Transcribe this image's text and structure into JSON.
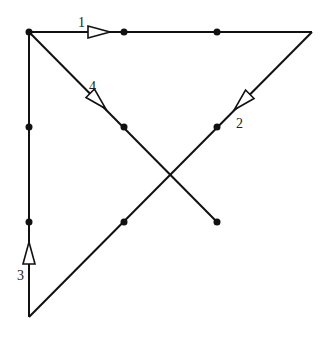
{
  "diagram": {
    "type": "directed-path-graph",
    "stroke_color": "#111111",
    "background": "#ffffff",
    "vertices": [
      {
        "id": "A",
        "x": 29,
        "y": 32
      },
      {
        "id": "B",
        "x": 124,
        "y": 32
      },
      {
        "id": "C",
        "x": 217,
        "y": 32
      },
      {
        "id": "D",
        "x": 312,
        "y": 32
      },
      {
        "id": "E",
        "x": 29,
        "y": 127
      },
      {
        "id": "F",
        "x": 124,
        "y": 127
      },
      {
        "id": "G",
        "x": 217,
        "y": 127
      },
      {
        "id": "H",
        "x": 29,
        "y": 222
      },
      {
        "id": "I",
        "x": 124,
        "y": 222
      },
      {
        "id": "J",
        "x": 217,
        "y": 222
      },
      {
        "id": "K",
        "x": 29,
        "y": 317
      }
    ],
    "dots": [
      "A",
      "B",
      "C",
      "E",
      "F",
      "G",
      "H",
      "I",
      "J"
    ],
    "edges": [
      {
        "from": "A",
        "to": "D",
        "label": "1"
      },
      {
        "from": "D",
        "to": "K",
        "label": "2"
      },
      {
        "from": "K",
        "to": "A",
        "label": "3"
      },
      {
        "from": "A",
        "to": "J",
        "label": "4"
      }
    ],
    "labels": [
      {
        "text": "1",
        "x": 78,
        "y": 27
      },
      {
        "text": "2",
        "x": 236,
        "y": 128
      },
      {
        "text": "3",
        "x": 17,
        "y": 280
      },
      {
        "text": "4",
        "x": 89,
        "y": 91
      }
    ]
  }
}
